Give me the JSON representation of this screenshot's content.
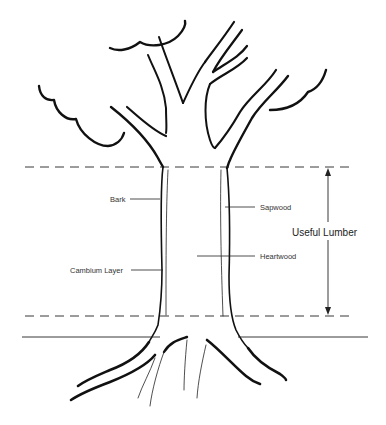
{
  "diagram": {
    "labels": {
      "bark": "Bark",
      "cambium": "Cambium Layer",
      "sapwood": "Sapwood",
      "heartwood": "Heartwood",
      "useful_lumber": "Useful Lumber"
    },
    "colors": {
      "line": "#111111",
      "text": "#333333",
      "background": "#ffffff"
    }
  }
}
